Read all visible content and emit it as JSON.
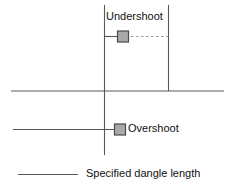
{
  "diagram": {
    "labels": {
      "undershoot": "Undershoot",
      "overshoot": "Overshoot",
      "legend": "Specified dangle length"
    },
    "colors": {
      "line": "#58585a",
      "marker_fill": "#a9a9a9",
      "marker_stroke": "#4a4a4a",
      "dashed": "#9b9b9b",
      "text": "#111111",
      "background": "#ffffff"
    },
    "geometry": {
      "vertical_left_x": 104,
      "vertical_right_x": 168,
      "vertical_top_y": 5,
      "vertical_left_bottom_y": 155,
      "baseline_y": 91,
      "baseline_x1": 11,
      "baseline_x2": 224,
      "undershoot_line_y": 36,
      "undershoot_line_x1": 104,
      "undershoot_line_x2": 122,
      "undershoot_marker_x": 122,
      "undershoot_marker_y": 36,
      "undershoot_dash_x1": 132,
      "undershoot_dash_x2": 168,
      "overshoot_line_y": 129,
      "overshoot_line_x1": 13,
      "overshoot_line_x2": 114,
      "overshoot_marker_x": 119,
      "overshoot_marker_y": 129,
      "legend_line_y": 174,
      "legend_line_x1": 18,
      "legend_line_x2": 78,
      "marker_size": 11
    }
  }
}
